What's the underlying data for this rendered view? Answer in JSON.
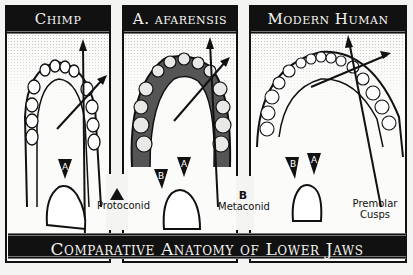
{
  "panels": [
    {
      "id": "chimp",
      "title": "Chimp"
    },
    {
      "id": "afarensis",
      "title": "A. afarensis"
    },
    {
      "id": "modern-human",
      "title": "Modern Human"
    }
  ],
  "cusp_markers": {
    "a": "A",
    "b": "B"
  },
  "legend": {
    "protoconid": {
      "marker": "A",
      "label": "Protoconid"
    },
    "metaconid": {
      "marker": "B",
      "label": "Metaconid"
    },
    "premolar": {
      "line1": "Premolar",
      "line2": "Cusps"
    }
  },
  "banner": {
    "title": "Comparative Anatomy of Lower Jaws"
  },
  "colors": {
    "ink": "#111111",
    "paper": "#fbfbfa",
    "banner_text": "#f4f4ee"
  }
}
